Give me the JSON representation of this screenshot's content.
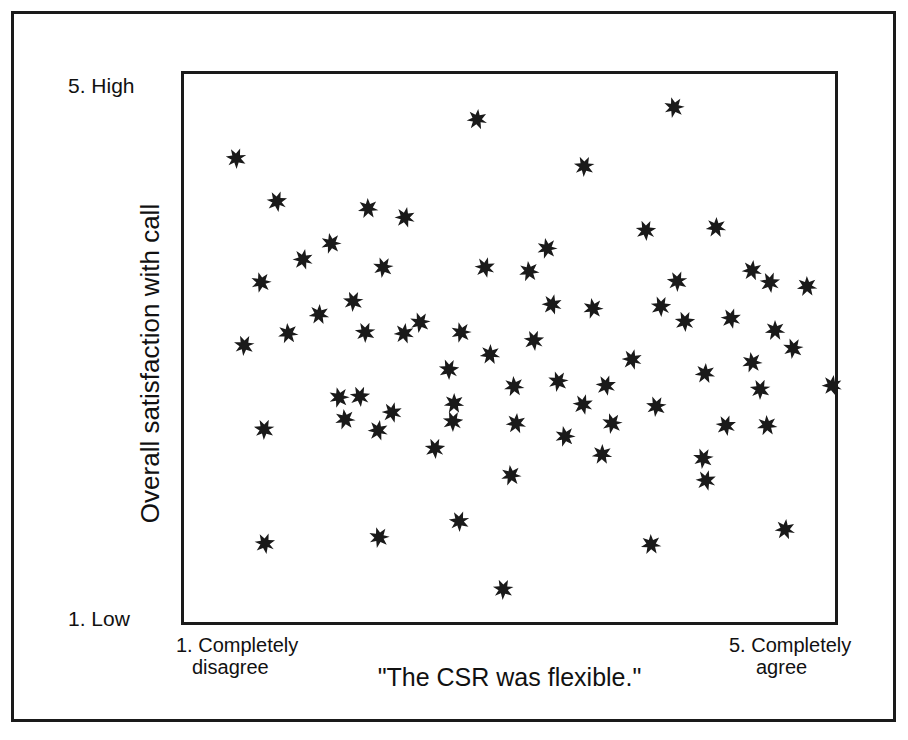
{
  "figure": {
    "background_color": "#ffffff",
    "frame_color": "#1a1a1a",
    "marker_color": "#1a1a1a",
    "marker_shape": "six-pointed-asterisk"
  },
  "axes": {
    "y_top_label": "5. High",
    "y_bottom_label": "1. Low",
    "y_axis_title": "Overall satisfaction with call",
    "x_left_label_line1": "1. Completely",
    "x_left_label_line2": "disagree",
    "x_right_label_line1": "5. Completely",
    "x_right_label_line2": "agree",
    "x_axis_title": "\"The CSR was flexible.\""
  },
  "chart_data": {
    "type": "scatter",
    "title": "",
    "xlabel": "\"The CSR was flexible.\"",
    "ylabel": "Overall satisfaction with call",
    "xlim": [
      1,
      5
    ],
    "ylim": [
      1,
      5
    ],
    "xtick_labels": [
      "1. Completely disagree",
      "5. Completely agree"
    ],
    "ytick_labels": [
      "1. Low",
      "5. High"
    ],
    "grid": false,
    "legend": false,
    "marker": "six-pointed-asterisk",
    "marker_color": "#1a1a1a",
    "n_points": 72,
    "relationship": "no apparent correlation (random scatter)",
    "points": [
      {
        "x": 1.32,
        "y": 4.39
      },
      {
        "x": 2.8,
        "y": 4.67
      },
      {
        "x": 4.01,
        "y": 4.76
      },
      {
        "x": 1.57,
        "y": 4.07
      },
      {
        "x": 2.13,
        "y": 4.02
      },
      {
        "x": 3.46,
        "y": 4.33
      },
      {
        "x": 2.36,
        "y": 3.96
      },
      {
        "x": 1.9,
        "y": 3.77
      },
      {
        "x": 3.84,
        "y": 3.86
      },
      {
        "x": 4.27,
        "y": 3.88
      },
      {
        "x": 2.22,
        "y": 3.59
      },
      {
        "x": 2.85,
        "y": 3.59
      },
      {
        "x": 3.12,
        "y": 3.56
      },
      {
        "x": 4.03,
        "y": 3.49
      },
      {
        "x": 4.49,
        "y": 3.57
      },
      {
        "x": 1.47,
        "y": 3.48
      },
      {
        "x": 4.6,
        "y": 3.48
      },
      {
        "x": 4.83,
        "y": 3.45
      },
      {
        "x": 2.04,
        "y": 3.34
      },
      {
        "x": 3.26,
        "y": 3.32
      },
      {
        "x": 3.51,
        "y": 3.29
      },
      {
        "x": 3.93,
        "y": 3.31
      },
      {
        "x": 1.83,
        "y": 3.25
      },
      {
        "x": 2.45,
        "y": 3.19
      },
      {
        "x": 4.36,
        "y": 3.22
      },
      {
        "x": 1.64,
        "y": 3.11
      },
      {
        "x": 2.11,
        "y": 3.12
      },
      {
        "x": 2.35,
        "y": 3.11
      },
      {
        "x": 2.7,
        "y": 3.12
      },
      {
        "x": 3.15,
        "y": 3.06
      },
      {
        "x": 4.63,
        "y": 3.13
      },
      {
        "x": 1.37,
        "y": 3.02
      },
      {
        "x": 3.75,
        "y": 2.92
      },
      {
        "x": 4.49,
        "y": 2.9
      },
      {
        "x": 2.63,
        "y": 2.85
      },
      {
        "x": 4.2,
        "y": 2.82
      },
      {
        "x": 3.3,
        "y": 2.76
      },
      {
        "x": 3.59,
        "y": 2.73
      },
      {
        "x": 3.03,
        "y": 2.72
      },
      {
        "x": 4.54,
        "y": 2.7
      },
      {
        "x": 4.98,
        "y": 2.73
      },
      {
        "x": 1.95,
        "y": 2.64
      },
      {
        "x": 2.08,
        "y": 2.65
      },
      {
        "x": 2.66,
        "y": 2.6
      },
      {
        "x": 3.9,
        "y": 2.58
      },
      {
        "x": 2.28,
        "y": 2.53
      },
      {
        "x": 1.99,
        "y": 2.48
      },
      {
        "x": 2.65,
        "y": 2.47
      },
      {
        "x": 3.04,
        "y": 2.45
      },
      {
        "x": 3.63,
        "y": 2.45
      },
      {
        "x": 4.33,
        "y": 2.44
      },
      {
        "x": 4.58,
        "y": 2.44
      },
      {
        "x": 1.49,
        "y": 2.41
      },
      {
        "x": 2.19,
        "y": 2.4
      },
      {
        "x": 3.34,
        "y": 2.36
      },
      {
        "x": 2.54,
        "y": 2.27
      },
      {
        "x": 3.57,
        "y": 2.23
      },
      {
        "x": 4.19,
        "y": 2.2
      },
      {
        "x": 4.21,
        "y": 2.04
      },
      {
        "x": 3.01,
        "y": 2.07
      },
      {
        "x": 2.69,
        "y": 1.74
      },
      {
        "x": 4.69,
        "y": 1.68
      },
      {
        "x": 2.2,
        "y": 1.62
      },
      {
        "x": 1.5,
        "y": 1.58
      },
      {
        "x": 3.87,
        "y": 1.57
      },
      {
        "x": 2.96,
        "y": 1.24
      },
      {
        "x": 1.73,
        "y": 3.65
      },
      {
        "x": 3.23,
        "y": 3.73
      },
      {
        "x": 4.08,
        "y": 3.2
      },
      {
        "x": 2.88,
        "y": 2.96
      },
      {
        "x": 4.74,
        "y": 3.0
      },
      {
        "x": 3.45,
        "y": 2.59
      }
    ]
  }
}
